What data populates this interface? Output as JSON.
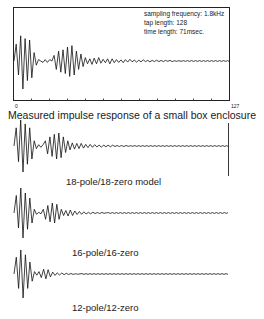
{
  "chart_data": [
    {
      "type": "line",
      "title": "Measured impulse response of a small box enclosure",
      "annotations": [
        "sampling frequency: 1.8kHz",
        "tap length: 128",
        "time length: 71msec."
      ],
      "xlabel": "",
      "ylabel": "",
      "xlim": [
        0,
        127
      ],
      "x_tick_labels": [
        "0",
        "127"
      ],
      "x_ticks_count": 13,
      "grid": false,
      "series": [
        {
          "name": "measured",
          "values": [
            0,
            0.6,
            -0.5,
            0.9,
            -1.0,
            0.8,
            -0.7,
            0.75,
            -0.6,
            0.3,
            -0.15,
            0.05,
            0.0,
            -0.05,
            0.05,
            -0.05,
            0.05,
            0.0,
            0.2,
            -0.3,
            0.35,
            -0.4,
            0.4,
            -0.45,
            0.5,
            -0.55,
            0.55,
            -0.5,
            0.35,
            -0.3,
            0.25,
            -0.2,
            0.12,
            -0.1,
            0.08,
            -0.12,
            0.1,
            -0.1,
            0.12,
            -0.08,
            0.06,
            -0.06,
            0.08,
            -0.1,
            0.08,
            -0.06,
            0.05,
            -0.05,
            0.04,
            -0.06,
            0.05,
            -0.04,
            0.06,
            -0.03,
            0.03,
            -0.04,
            0.03,
            -0.03,
            0.04,
            -0.02,
            0.02,
            -0.03,
            0.02,
            -0.02,
            0.03,
            -0.02,
            0.02,
            -0.02,
            0.02,
            -0.01,
            0.02,
            -0.02,
            0.01,
            -0.01,
            0.01,
            -0.01,
            0.01,
            -0.01
          ]
        }
      ]
    },
    {
      "type": "line",
      "title": "18-pole/18-zero model",
      "xlim": [
        0,
        127
      ],
      "series": [
        {
          "name": "18-pole/18-zero",
          "values": [
            0,
            0.7,
            -0.6,
            1.0,
            -1.0,
            0.85,
            -0.7,
            0.7,
            -0.5,
            0.2,
            -0.1,
            0.05,
            -0.05,
            0.05,
            0.2,
            -0.3,
            0.35,
            -0.4,
            0.45,
            -0.5,
            0.5,
            -0.45,
            0.35,
            -0.25,
            0.2,
            -0.15,
            0.12,
            -0.12,
            0.1,
            -0.1,
            0.1,
            -0.08,
            0.06,
            -0.06,
            0.06,
            -0.05,
            0.05,
            -0.04,
            0.04,
            -0.05,
            0.04,
            -0.03,
            0.03,
            -0.03,
            0.03,
            -0.02,
            0.02,
            -0.02,
            0.02,
            -0.02,
            0.02,
            -0.01,
            0.01,
            -0.01
          ]
        }
      ]
    },
    {
      "type": "line",
      "title": "16-pole/16-zero",
      "xlim": [
        0,
        127
      ],
      "series": [
        {
          "name": "16-pole/16-zero",
          "values": [
            0,
            0.7,
            -0.6,
            1.0,
            -1.0,
            0.8,
            -0.65,
            0.6,
            -0.4,
            0.15,
            -0.05,
            0.03,
            -0.03,
            0.15,
            -0.25,
            0.3,
            -0.35,
            0.4,
            -0.4,
            0.35,
            -0.25,
            0.15,
            -0.1,
            0.1,
            -0.12,
            0.12,
            -0.1,
            0.08,
            -0.06,
            0.06,
            -0.05,
            0.05,
            -0.04,
            0.03,
            -0.03,
            0.03,
            -0.02,
            0.02,
            -0.02,
            0.02,
            -0.01,
            0.01
          ]
        }
      ]
    },
    {
      "type": "line",
      "title": "12-pole/12-zero",
      "xlim": [
        0,
        127
      ],
      "series": [
        {
          "name": "12-pole/12-zero",
          "values": [
            0,
            0.7,
            -0.6,
            1.0,
            -1.0,
            0.8,
            -0.6,
            0.5,
            -0.3,
            0.1,
            -0.05,
            0.1,
            -0.15,
            0.2,
            -0.2,
            0.18,
            -0.12,
            0.08,
            -0.06,
            0.05,
            -0.04,
            0.04,
            -0.03,
            0.03,
            -0.02,
            0.02,
            -0.015,
            0.01,
            -0.01,
            0.005
          ]
        }
      ]
    }
  ],
  "plot1": {
    "info": [
      "sampling frequency: 1.8kHz",
      "tap length: 128",
      "time length: 71msec."
    ],
    "tick_start": "0",
    "tick_end": "127",
    "caption": "Measured impulse response of a small box enclosure"
  },
  "plot2": {
    "caption": "18-pole/18-zero model"
  },
  "plot3": {
    "caption": "16-pole/16-zero"
  },
  "plot4": {
    "caption": "12-pole/12-zero"
  }
}
